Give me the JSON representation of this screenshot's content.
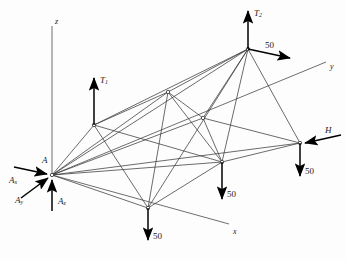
{
  "figure": {
    "type": "engineering-free-body-diagram",
    "background": "#fdfdfd",
    "line_color": "#3a3a3a",
    "arrow_color": "#000000"
  },
  "axes": [
    {
      "name": "z-axis",
      "label": "z",
      "label_x": 55,
      "label_y": 18,
      "x1": 52,
      "y1": 175,
      "x2": 52,
      "y2": 26
    },
    {
      "name": "y-axis",
      "label": "y",
      "label_x": 330,
      "label_y": 63,
      "x1": 52,
      "y1": 175,
      "x2": 326,
      "y2": 62
    },
    {
      "name": "x-axis",
      "label": "x",
      "label_x": 233,
      "label_y": 228,
      "x1": 52,
      "y1": 175,
      "x2": 229,
      "y2": 224
    }
  ],
  "nodes": [
    {
      "id": "A",
      "name": "support-node-a",
      "x": 52,
      "y": 175,
      "label": "A",
      "label_x": 42,
      "label_y": 156
    },
    {
      "id": "B",
      "name": "node-upper-left",
      "x": 94,
      "y": 125,
      "label": "",
      "label_x": 0,
      "label_y": 0
    },
    {
      "id": "C",
      "name": "node-apex",
      "x": 248,
      "y": 49,
      "label": "",
      "label_x": 0,
      "label_y": 0
    },
    {
      "id": "D",
      "name": "node-interior-upper",
      "x": 168,
      "y": 92,
      "label": "",
      "label_x": 0,
      "label_y": 0
    },
    {
      "id": "E",
      "name": "node-interior-mid",
      "x": 203,
      "y": 118,
      "label": "",
      "label_x": 0,
      "label_y": 0
    },
    {
      "id": "F",
      "name": "node-lower-center",
      "x": 148,
      "y": 208,
      "label": "",
      "label_x": 0,
      "label_y": 0
    },
    {
      "id": "G",
      "name": "node-lower-mid",
      "x": 222,
      "y": 162,
      "label": "",
      "label_x": 0,
      "label_y": 0
    },
    {
      "id": "H2",
      "name": "node-right",
      "x": 300,
      "y": 143,
      "label": "",
      "label_x": 0,
      "label_y": 0
    }
  ],
  "members": [
    {
      "name": "member-a-b",
      "from": "A",
      "to": "B"
    },
    {
      "name": "member-a-c",
      "from": "A",
      "to": "C"
    },
    {
      "name": "member-a-d",
      "from": "A",
      "to": "D"
    },
    {
      "name": "member-a-e",
      "from": "A",
      "to": "E"
    },
    {
      "name": "member-a-f",
      "from": "A",
      "to": "F"
    },
    {
      "name": "member-a-g",
      "from": "A",
      "to": "G"
    },
    {
      "name": "member-a-h",
      "from": "A",
      "to": "H2"
    },
    {
      "name": "member-b-c",
      "from": "B",
      "to": "C"
    },
    {
      "name": "member-b-d",
      "from": "B",
      "to": "D"
    },
    {
      "name": "member-b-f",
      "from": "B",
      "to": "F"
    },
    {
      "name": "member-b-g",
      "from": "B",
      "to": "G"
    },
    {
      "name": "member-c-d",
      "from": "C",
      "to": "D"
    },
    {
      "name": "member-c-e",
      "from": "C",
      "to": "E"
    },
    {
      "name": "member-c-f",
      "from": "C",
      "to": "F"
    },
    {
      "name": "member-c-g",
      "from": "C",
      "to": "G"
    },
    {
      "name": "member-c-h",
      "from": "C",
      "to": "H2"
    },
    {
      "name": "member-d-e",
      "from": "D",
      "to": "E"
    },
    {
      "name": "member-d-f",
      "from": "D",
      "to": "F"
    },
    {
      "name": "member-d-g",
      "from": "D",
      "to": "G"
    },
    {
      "name": "member-e-g",
      "from": "E",
      "to": "G"
    },
    {
      "name": "member-e-h",
      "from": "E",
      "to": "H2"
    },
    {
      "name": "member-f-g",
      "from": "F",
      "to": "G"
    },
    {
      "name": "member-g-h",
      "from": "G",
      "to": "H2"
    }
  ],
  "forces": [
    {
      "name": "force-t1",
      "label": "T",
      "sub": "1",
      "x1": 94,
      "y1": 125,
      "x2": 94,
      "y2": 78,
      "label_x": 100,
      "label_y": 76,
      "italic": true
    },
    {
      "name": "force-t2",
      "label": "T",
      "sub": "2",
      "x1": 248,
      "y1": 49,
      "x2": 248,
      "y2": 11,
      "label_x": 254,
      "label_y": 9,
      "italic": true
    },
    {
      "name": "force-50-apex",
      "label": "50",
      "sub": "",
      "x1": 248,
      "y1": 49,
      "x2": 290,
      "y2": 58,
      "label_x": 265,
      "label_y": 41,
      "italic": false
    },
    {
      "name": "force-h",
      "label": "H",
      "sub": "",
      "x1": 341,
      "y1": 135,
      "x2": 305,
      "y2": 143,
      "label_x": 325,
      "label_y": 126,
      "italic": true
    },
    {
      "name": "force-50-right",
      "label": "50",
      "sub": "",
      "x1": 300,
      "y1": 143,
      "x2": 300,
      "y2": 176,
      "label_x": 305,
      "label_y": 167,
      "italic": false
    },
    {
      "name": "force-50-mid",
      "label": "50",
      "sub": "",
      "x1": 222,
      "y1": 162,
      "x2": 222,
      "y2": 199,
      "label_x": 227,
      "label_y": 190,
      "italic": false
    },
    {
      "name": "force-50-lower",
      "label": "50",
      "sub": "",
      "x1": 148,
      "y1": 208,
      "x2": 148,
      "y2": 240,
      "label_x": 153,
      "label_y": 232,
      "italic": false
    },
    {
      "name": "reaction-ax",
      "label": "A",
      "sub": "x",
      "x1": 14,
      "y1": 167,
      "x2": 47,
      "y2": 174,
      "label_x": 9,
      "label_y": 176,
      "italic": true
    },
    {
      "name": "reaction-ay",
      "label": "A",
      "sub": "y",
      "x1": 21,
      "y1": 198,
      "x2": 48,
      "y2": 178,
      "label_x": 15,
      "label_y": 196,
      "italic": true
    },
    {
      "name": "reaction-az",
      "label": "A",
      "sub": "z",
      "x1": 52,
      "y1": 211,
      "x2": 52,
      "y2": 180,
      "label_x": 58,
      "label_y": 197,
      "italic": true
    }
  ],
  "load_value": "50",
  "tension_labels": [
    "T1",
    "T2"
  ],
  "reaction_labels": [
    "Ax",
    "Ay",
    "Az"
  ]
}
